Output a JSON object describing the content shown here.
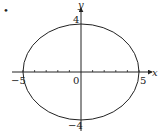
{
  "figure": {
    "marker": "•",
    "shape": "ellipse",
    "equation_hint": "x^2/25 + y^2/16 = 1",
    "semi_axis_x": 5,
    "semi_axis_y": 4,
    "axes": {
      "x_label": "x",
      "y_label": "y",
      "x_ticks_from": -5,
      "x_ticks_to": 5,
      "tick_step": 1
    },
    "labels": {
      "x_neg": "−5",
      "x_pos": "5",
      "origin": "0",
      "y_pos": "4",
      "y_neg": "−4"
    },
    "colors": {
      "stroke": "#222222",
      "background": "#ffffff"
    }
  }
}
